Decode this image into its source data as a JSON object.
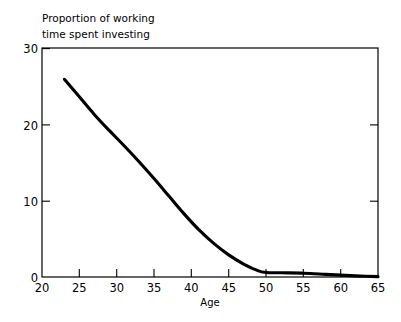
{
  "chart_data": {
    "type": "line",
    "title": "",
    "ylabel": "Proportion of working time spent investing",
    "ylabel_line1": "Proportion of working",
    "ylabel_line2": "time spent investing",
    "xlabel": "Age",
    "xlim": [
      20,
      65
    ],
    "ylim": [
      0,
      30
    ],
    "xticks": [
      20,
      25,
      30,
      35,
      40,
      45,
      50,
      55,
      60,
      65
    ],
    "xticklabels": [
      "20",
      "25",
      "30",
      "35",
      "40",
      "45",
      "50",
      "55",
      "60",
      "65"
    ],
    "yticks": [
      0,
      10,
      20,
      30
    ],
    "yticklabels": [
      "0",
      "10",
      "20",
      "30"
    ],
    "grid": false,
    "legend": false,
    "series": [
      {
        "name": "Proportion of working time spent investing",
        "color": "#000000",
        "x": [
          23,
          25,
          27,
          29,
          31,
          33,
          35,
          37,
          39,
          41,
          43,
          45,
          47,
          49,
          50,
          52,
          55,
          58,
          60,
          62,
          65
        ],
        "values": [
          25.9,
          23.6,
          21.3,
          19.2,
          17.2,
          15.1,
          12.9,
          10.6,
          8.3,
          6.2,
          4.4,
          2.9,
          1.7,
          0.8,
          0.6,
          0.55,
          0.5,
          0.35,
          0.25,
          0.15,
          0.05
        ]
      }
    ]
  },
  "annotations": {
    "curve_start_age": "23",
    "curve_start_value": "25.9",
    "curve_end_age": "65",
    "curve_end_value": "0"
  }
}
